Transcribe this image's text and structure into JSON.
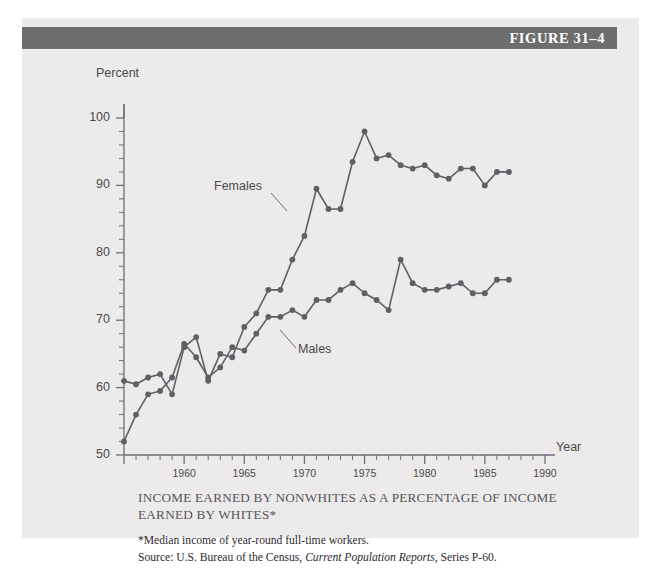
{
  "header": {
    "figure_label": "FIGURE 31–4",
    "bar_color": "#6e6e6e"
  },
  "panel": {
    "background": "#eceaea"
  },
  "axes": {
    "ylabel": "Percent",
    "xlabel": "Year",
    "y_ticks": [
      "50",
      "60",
      "70",
      "80",
      "90",
      "100"
    ],
    "x_ticks": [
      "1960",
      "1965",
      "1970",
      "1975",
      "1980",
      "1985",
      "1990"
    ]
  },
  "series_labels": {
    "females": "Females",
    "males": "Males"
  },
  "caption": {
    "title": "INCOME EARNED BY NONWHITES AS A PERCENTAGE OF INCOME EARNED BY WHITES*",
    "note": "*Median income of year-round full-time workers.",
    "source_prefix": "Source: U.S. Bureau of the Census, ",
    "source_italic": "Current Population Reports",
    "source_suffix": ", Series P-60."
  },
  "chart_data": {
    "type": "line",
    "title": "INCOME EARNED BY NONWHITES AS A PERCENTAGE OF INCOME EARNED BY WHITES*",
    "xlabel": "Year",
    "ylabel": "Percent",
    "xlim": [
      1955,
      1990
    ],
    "ylim": [
      50,
      100
    ],
    "grid": false,
    "legend_position": "inline-annotations",
    "y_major_step": 10,
    "y_minor_step": 2,
    "x_major_step": 5,
    "x_minor_step": 1,
    "line_color": "#5f5f66",
    "marker_color": "#5f5f66",
    "x": [
      1955,
      1956,
      1957,
      1958,
      1959,
      1960,
      1961,
      1962,
      1963,
      1964,
      1965,
      1966,
      1967,
      1968,
      1969,
      1970,
      1971,
      1972,
      1973,
      1974,
      1975,
      1976,
      1977,
      1978,
      1979,
      1980,
      1981,
      1982,
      1983,
      1984,
      1985,
      1986,
      1987
    ],
    "series": [
      {
        "name": "Females",
        "values": [
          61,
          60.5,
          61.5,
          62,
          59,
          66,
          67.5,
          61,
          65,
          64.5,
          69,
          71,
          74.5,
          74.5,
          79,
          82.5,
          89.5,
          86.5,
          86.5,
          93.5,
          98,
          94,
          94.5,
          93,
          92.5,
          93,
          91.5,
          91,
          92.5,
          92.5,
          90,
          92,
          92
        ]
      },
      {
        "name": "Males",
        "values": [
          52,
          56,
          59,
          59.5,
          61.5,
          66.5,
          64.5,
          61.5,
          63,
          66,
          65.5,
          68,
          70.5,
          70.5,
          71.5,
          70.5,
          73,
          73,
          74.5,
          75.5,
          74,
          73,
          71.5,
          79,
          75.5,
          74.5,
          74.5,
          75,
          75.5,
          74,
          74,
          76,
          76
        ]
      }
    ]
  }
}
